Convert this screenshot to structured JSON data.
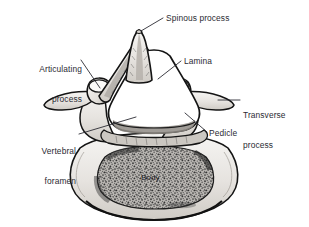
{
  "figure": {
    "name": "vertebra-superior-view",
    "background_color": "#ffffff",
    "ink_color": "#1a1a1a",
    "label_color": "#2b2b33",
    "bone_cortical_color": "#e9e7e3",
    "bone_cancellous_color": "#8a8a8a",
    "leader_color": "#2b2b33"
  },
  "labels": {
    "spinous_process": "Spinous process",
    "articulating_process_line1": "Articulating",
    "articulating_process_line2": "process",
    "lamina": "Lamina",
    "transverse_process_line1": "Transverse",
    "transverse_process_line2": "process",
    "vertebral_foramen_line1": "Vertebral",
    "vertebral_foramen_line2": "foramen",
    "pedicle": "Pedicle",
    "body": "Body"
  },
  "anatomy_parts": [
    {
      "id": "spinous-process",
      "label": "Spinous process",
      "leader_from": [
        141,
        31
      ],
      "leader_to": [
        163,
        18
      ]
    },
    {
      "id": "articulating-process",
      "label": "Articulating process",
      "leader_from": [
        100,
        88
      ],
      "leader_to": [
        80,
        58
      ]
    },
    {
      "id": "lamina",
      "label": "Lamina",
      "leader_from": [
        158,
        79
      ],
      "leader_to": [
        182,
        60
      ]
    },
    {
      "id": "transverse-process",
      "label": "Transverse process",
      "leader_from": [
        218,
        100
      ],
      "leader_to": [
        238,
        100
      ]
    },
    {
      "id": "vertebral-foramen",
      "label": "Vertebral foramen",
      "leader_from": [
        136,
        117
      ],
      "leader_to": [
        80,
        133
      ]
    },
    {
      "id": "pedicle",
      "label": "Pedicle",
      "leader_from": [
        185,
        113
      ],
      "leader_to": [
        208,
        132
      ]
    },
    {
      "id": "body",
      "label": "Body",
      "leader_from": null,
      "leader_to": null
    }
  ]
}
